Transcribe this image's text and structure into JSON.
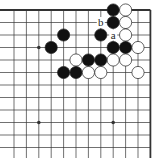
{
  "diagram": {
    "type": "go-board-fragment",
    "columns": 12,
    "rows": 13,
    "origin_x": 14,
    "origin_y": 10,
    "spacing_x": 12.4,
    "spacing_y": 12.5,
    "edges": {
      "top": true,
      "right": true,
      "left": false,
      "bottom": false
    },
    "colors": {
      "line": "#333333",
      "black": "#111111",
      "white": "#ffffff",
      "stone_outline": "#222222"
    },
    "star_points": [
      {
        "col": 2,
        "row": 3
      },
      {
        "col": 2,
        "row": 9
      },
      {
        "col": 8,
        "row": 9
      }
    ],
    "stones": [
      {
        "col": 8,
        "row": 0,
        "color": "black"
      },
      {
        "col": 9,
        "row": 0,
        "color": "white"
      },
      {
        "col": 8,
        "row": 1,
        "color": "black"
      },
      {
        "col": 9,
        "row": 1,
        "color": "white"
      },
      {
        "col": 4,
        "row": 2,
        "color": "black"
      },
      {
        "col": 7,
        "row": 2,
        "color": "black"
      },
      {
        "col": 9,
        "row": 2,
        "color": "white"
      },
      {
        "col": 3,
        "row": 3,
        "color": "black"
      },
      {
        "col": 8,
        "row": 3,
        "color": "black"
      },
      {
        "col": 9,
        "row": 3,
        "color": "black"
      },
      {
        "col": 10,
        "row": 3,
        "color": "white"
      },
      {
        "col": 5,
        "row": 4,
        "color": "white"
      },
      {
        "col": 6,
        "row": 4,
        "color": "black"
      },
      {
        "col": 7,
        "row": 4,
        "color": "black"
      },
      {
        "col": 8,
        "row": 4,
        "color": "white"
      },
      {
        "col": 9,
        "row": 4,
        "color": "white"
      },
      {
        "col": 4,
        "row": 5,
        "color": "black"
      },
      {
        "col": 5,
        "row": 5,
        "color": "black"
      },
      {
        "col": 6,
        "row": 5,
        "color": "white"
      },
      {
        "col": 7,
        "row": 5,
        "color": "white"
      },
      {
        "col": 10,
        "row": 5,
        "color": "white"
      }
    ],
    "labels": [
      {
        "col": 7,
        "row": 1,
        "text": "b"
      },
      {
        "col": 8,
        "row": 2,
        "text": "a"
      }
    ]
  }
}
